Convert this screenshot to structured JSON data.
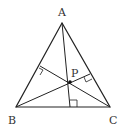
{
  "diagram": {
    "labels": {
      "A": "A",
      "B": "B",
      "C": "C",
      "P": "P"
    },
    "points": {
      "A": [
        62,
        23
      ],
      "B": [
        16,
        107
      ],
      "C": [
        110,
        107
      ],
      "P": [
        70,
        82
      ],
      "foot_BC": [
        70,
        107
      ],
      "foot_AB": [
        40,
        66
      ],
      "foot_AC": [
        90,
        74
      ]
    },
    "colors": {
      "line": "#222222",
      "text": "#333333",
      "background": "#ffffff"
    }
  }
}
